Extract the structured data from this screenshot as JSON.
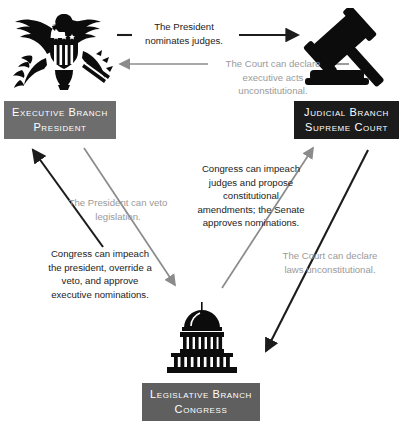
{
  "diagram": {
    "colors": {
      "executive_box": "#6d6d6d",
      "judicial_box": "#1b1b1b",
      "legislative_box": "#5f5f5f",
      "arrow_dark": "#1c1c1c",
      "arrow_gray": "#8b8b8b",
      "text_dark": "#1c1c1c",
      "text_mid": "#6f6f6f",
      "text_light": "#9a9a9a",
      "background": "#ffffff"
    }
  },
  "branches": {
    "executive": {
      "icon": "eagle-seal-icon",
      "line1": "Executive Branch",
      "line2": "President"
    },
    "judicial": {
      "icon": "gavel-icon",
      "line1": "Judicial Branch",
      "line2": "Supreme Court"
    },
    "legislative": {
      "icon": "capitol-building-icon",
      "line1": "Legislative Branch",
      "line2": "Congress"
    }
  },
  "captions": {
    "nominates_judges": "The President\nnominates judges.",
    "executive_acts": "The Court can declare\nexecutive acts\nunconstitutional.",
    "president_veto": "The President can veto\nlegislation.",
    "impeach_judges": "Congress can impeach\njudges and propose\nconstitutional\namendments; the Senate\napproves nominations.",
    "impeach_president": "Congress can impeach\nthe president, override a\nveto, and approve\nexecutive nominations.",
    "laws_unconstitutional": "The Court can declare\nlaws unconstitutional."
  }
}
